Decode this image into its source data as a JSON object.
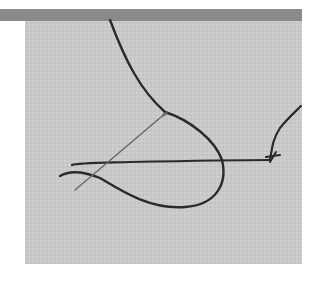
{
  "image": {
    "description": "Needle and dark thread forming a loop on light gray linen fabric",
    "colors": {
      "background": "#ffffff",
      "top_bar": "#8a8a8a",
      "fabric": "#c9c9c9",
      "thread": "#2a2a2a",
      "needle": "#6a6a6a"
    }
  }
}
